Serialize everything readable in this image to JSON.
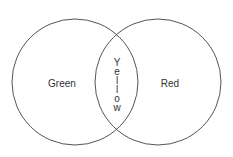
{
  "diagram": {
    "type": "venn",
    "sets": [
      {
        "name": "left-set",
        "label": "Green"
      },
      {
        "name": "right-set",
        "label": "Red"
      }
    ],
    "intersection": {
      "label": "Yellow",
      "letters": [
        "Y",
        "e",
        "l",
        "l",
        "o",
        "w"
      ]
    },
    "stroke_color": "#555555"
  }
}
